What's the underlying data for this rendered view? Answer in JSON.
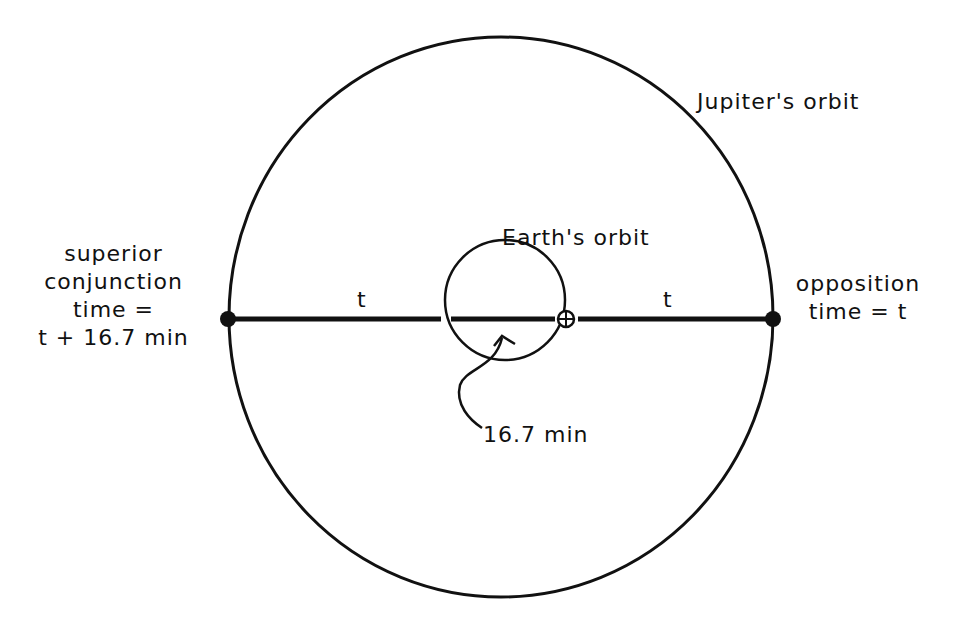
{
  "diagram": {
    "title_labels": {
      "jupiter_orbit": "Jupiter's orbit",
      "earth_orbit": "Earth's orbit"
    },
    "left_label": {
      "line1": "superior",
      "line2": "conjunction",
      "line3": "time =",
      "line4": "t + 16.7 min"
    },
    "right_label": {
      "line1": "opposition",
      "line2": "time = t"
    },
    "segment_labels": {
      "left_t": "t",
      "right_t": "t"
    },
    "delay_label": "16.7 min",
    "earth_symbol": "⊕",
    "colors": {
      "ink": "#111111",
      "background": "#ffffff"
    }
  }
}
